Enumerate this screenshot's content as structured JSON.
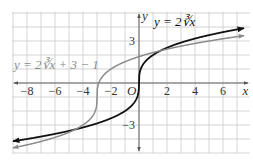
{
  "chart_data": {
    "type": "line",
    "title": "",
    "xlabel": "x",
    "ylabel": "y",
    "origin_label": "O",
    "xlim": [
      -9,
      8
    ],
    "ylim": [
      -5,
      5
    ],
    "grid": true,
    "x_ticks": [
      {
        "value": -8,
        "label": "−8"
      },
      {
        "value": -6,
        "label": "−6"
      },
      {
        "value": -4,
        "label": "−4"
      },
      {
        "value": -2,
        "label": "−2"
      },
      {
        "value": 2,
        "label": "2"
      },
      {
        "value": 4,
        "label": "4"
      },
      {
        "value": 6,
        "label": "6"
      }
    ],
    "y_ticks": [
      {
        "value": 3,
        "label": "3"
      },
      {
        "value": -3,
        "label": "−3"
      }
    ],
    "series": [
      {
        "name": "y = 2∛x",
        "label": "y = 2∛x",
        "color": "#111111",
        "function": "2*cbrt(x)",
        "domain": [
          -9,
          7.5
        ]
      },
      {
        "name": "y = 2∛(x + 3) − 1",
        "label": "y = 2∛x + 3 − 1",
        "color": "#8a8a8a",
        "function": "2*cbrt(x+3)-1",
        "domain": [
          -9,
          7.5
        ]
      }
    ]
  }
}
